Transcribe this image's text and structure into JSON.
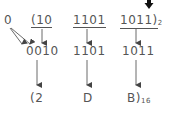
{
  "diagram": {
    "row1": {
      "pad": "0",
      "group1": "(10",
      "group2": "1101",
      "group3": "1011)",
      "base_sub": "2"
    },
    "row2": {
      "group1": "0010",
      "group2": "1101",
      "group3": "1011"
    },
    "row3": {
      "digit1": "(2",
      "digit2": "D",
      "digit3": "B)",
      "base_sub": "16"
    },
    "colors": {
      "text": "#555555",
      "arrow": "#444444",
      "top_arrow": "#111111"
    }
  }
}
